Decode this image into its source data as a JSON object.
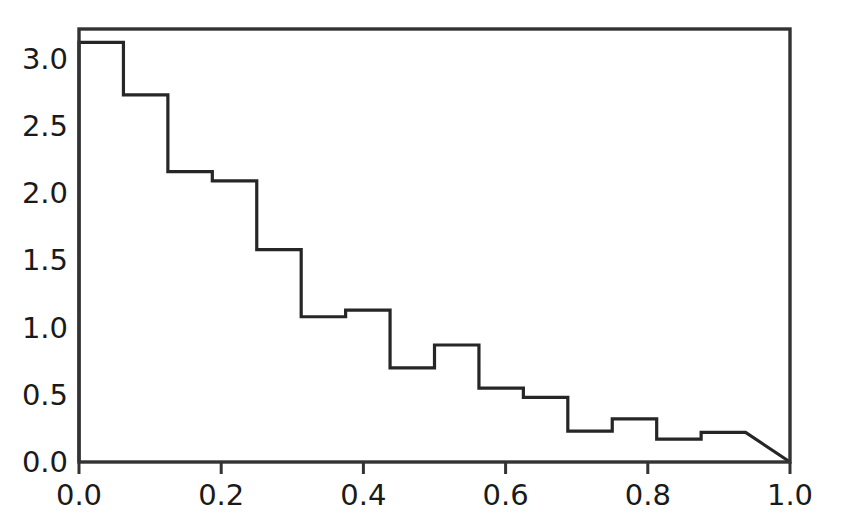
{
  "chart_data": {
    "type": "bar",
    "subtype": "histogram-step-outline",
    "title": "",
    "subtitle": "",
    "xlabel": "",
    "ylabel": "",
    "xlim": [
      0.0,
      1.0
    ],
    "ylim": [
      0.0,
      3.22
    ],
    "grid": false,
    "legend": null,
    "legend_position": "none",
    "xticks": [
      0.0,
      0.2,
      0.4,
      0.6,
      0.8,
      1.0
    ],
    "xtick_labels": [
      "0.0",
      "0.2",
      "0.4",
      "0.6",
      "0.8",
      "1.0"
    ],
    "yticks": [
      0.0,
      0.5,
      1.0,
      1.5,
      2.0,
      2.5,
      3.0
    ],
    "ytick_labels": [
      "0.0",
      "0.5",
      "1.0",
      "1.5",
      "2.0",
      "2.5",
      "3.0"
    ],
    "bin_width": 0.0625,
    "bin_edges": [
      0.0,
      0.0625,
      0.125,
      0.1875,
      0.25,
      0.3125,
      0.375,
      0.4375,
      0.5,
      0.5625,
      0.625,
      0.6875,
      0.75,
      0.8125,
      0.875,
      0.9375
    ],
    "values": [
      3.12,
      2.73,
      2.16,
      2.09,
      1.58,
      1.08,
      1.13,
      0.7,
      0.87,
      0.55,
      0.48,
      0.23,
      0.32,
      0.17,
      0.22
    ],
    "bin_centers": [
      0.031,
      0.094,
      0.156,
      0.219,
      0.281,
      0.344,
      0.406,
      0.469,
      0.531,
      0.594,
      0.656,
      0.719,
      0.781,
      0.844,
      0.906
    ],
    "series": [
      {
        "name": "density",
        "values": [
          3.12,
          2.73,
          2.16,
          2.09,
          1.58,
          1.08,
          1.13,
          0.7,
          0.87,
          0.55,
          0.48,
          0.23,
          0.32,
          0.17,
          0.22
        ]
      }
    ],
    "annotations": [],
    "colors": {
      "line": "#262626",
      "frame": "#333333",
      "background": "#ffffff",
      "text": "#1a1a1a"
    }
  },
  "axes": {
    "frame_color": "#333333",
    "line_color": "#262626"
  }
}
